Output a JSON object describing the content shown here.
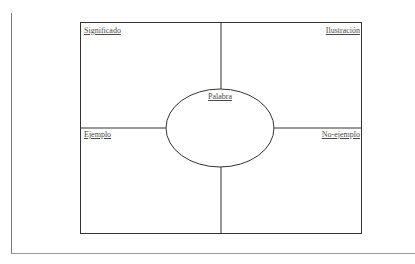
{
  "diagram": {
    "type": "frayer-model",
    "center_word_label": "Palabra",
    "quadrants": {
      "top_left": "Significado",
      "top_right": "Ilustración",
      "bottom_left": "Ejemplo",
      "bottom_right": "No-ejemplo"
    },
    "colors": {
      "line": "#333333",
      "text": "#4a4a4a",
      "background": "#ffffff"
    }
  }
}
